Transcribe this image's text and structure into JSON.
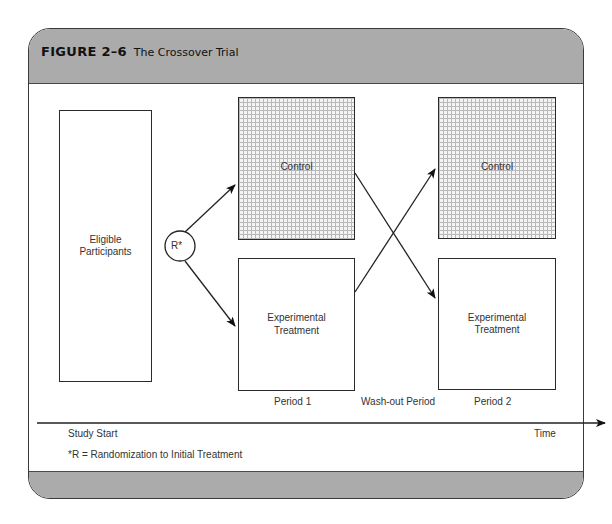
{
  "figure": {
    "number": "FIGURE 2–6",
    "caption": "The Crossover Trial"
  },
  "diagram": {
    "eligible": "Eligible Participants",
    "eligible_lines": [
      "Eligible",
      "Participants"
    ],
    "randomization_node": "R*",
    "period1": {
      "control": "Control",
      "treatment_lines": [
        "Experimental",
        "Treatment"
      ],
      "label": "Period 1"
    },
    "washout_label": "Wash-out Period",
    "period2": {
      "control": "Control",
      "treatment_lines": [
        "Experimental",
        "Treatment"
      ],
      "label": "Period 2"
    },
    "timeline": {
      "start_label": "Study Start",
      "end_label": "Time"
    },
    "footnote": "*R = Randomization to Initial Treatment"
  },
  "colors": {
    "band": "#ababab",
    "border": "#3a3a3a",
    "grid": "#b8b8b8"
  }
}
